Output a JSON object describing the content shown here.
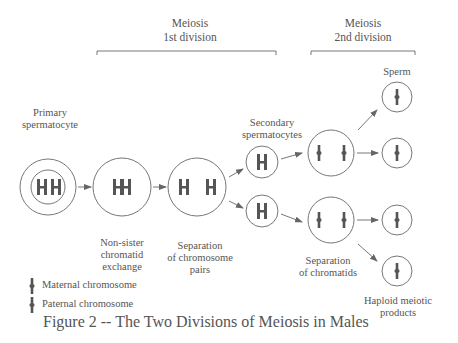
{
  "headers": {
    "meiosis1": [
      "Meiosis",
      "1st division"
    ],
    "meiosis2": [
      "Meiosis",
      "2nd division"
    ]
  },
  "labels": {
    "primary": [
      "Primary",
      "spermatocyte"
    ],
    "secondary": [
      "Secondary",
      "spermatocytes"
    ],
    "sperm": "Sperm",
    "exchange": [
      "Non-sister",
      "chromatid",
      "exchange"
    ],
    "separation_pairs": [
      "Separation",
      "of chromosome",
      "pairs"
    ],
    "separation_chromatids": [
      "Separation",
      "of chromatids"
    ],
    "haploid": [
      "Haploid meiotic",
      "products"
    ]
  },
  "legend": {
    "maternal": "Maternal chromosome",
    "paternal": "Paternal chromosome"
  },
  "caption": "Figure 2 -- The Two Divisions of Meiosis in Males",
  "colors": {
    "line": "#777777",
    "chromosome": "#555555",
    "text": "#555555"
  }
}
